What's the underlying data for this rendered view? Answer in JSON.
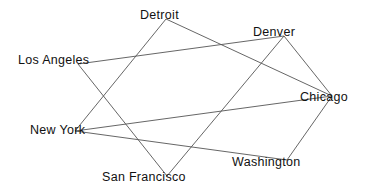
{
  "diagram": {
    "type": "graph",
    "colors": {
      "edge": "#555555",
      "label": "#111111",
      "background": "#ffffff"
    },
    "nodes": [
      {
        "id": "detroit",
        "label": "Detroit",
        "x": 166,
        "y": 19,
        "lx": 140,
        "ly": 19
      },
      {
        "id": "denver",
        "label": "Denver",
        "x": 284,
        "y": 36,
        "lx": 253,
        "ly": 36
      },
      {
        "id": "los_angeles",
        "label": "Los Angeles",
        "x": 78,
        "y": 64,
        "lx": 18,
        "ly": 64
      },
      {
        "id": "chicago",
        "label": "Chicago",
        "x": 332,
        "y": 96,
        "lx": 300,
        "ly": 101
      },
      {
        "id": "new_york",
        "label": "New York",
        "x": 75,
        "y": 131,
        "lx": 30,
        "ly": 134
      },
      {
        "id": "washington",
        "label": "Washington",
        "x": 287,
        "y": 160,
        "lx": 232,
        "ly": 166
      },
      {
        "id": "san_francisco",
        "label": "San Francisco",
        "x": 167,
        "y": 176,
        "lx": 102,
        "ly": 181
      }
    ],
    "edges": [
      {
        "from": "los_angeles",
        "to": "denver"
      },
      {
        "from": "los_angeles",
        "to": "san_francisco"
      },
      {
        "from": "detroit",
        "to": "new_york"
      },
      {
        "from": "detroit",
        "to": "chicago"
      },
      {
        "from": "denver",
        "to": "san_francisco"
      },
      {
        "from": "denver",
        "to": "chicago"
      },
      {
        "from": "chicago",
        "to": "new_york"
      },
      {
        "from": "chicago",
        "to": "washington"
      },
      {
        "from": "new_york",
        "to": "washington"
      }
    ]
  }
}
